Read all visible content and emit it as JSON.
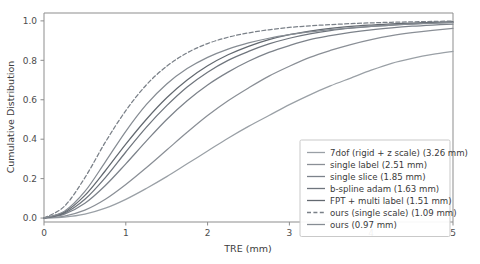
{
  "chart_data": {
    "type": "line",
    "title": "",
    "xlabel": "TRE (mm)",
    "ylabel": "Cumulative Distribution",
    "xlim": [
      0,
      5
    ],
    "ylim": [
      -0.02,
      1.04
    ],
    "xticks": [
      "0",
      "1",
      "2",
      "3",
      "4",
      "5"
    ],
    "xtick_values": [
      0,
      1,
      2,
      3,
      4,
      5
    ],
    "yticks": [
      "0.0",
      "0.2",
      "0.4",
      "0.6",
      "0.8",
      "1.0"
    ],
    "ytick_values": [
      0.0,
      0.2,
      0.4,
      0.6,
      0.8,
      1.0
    ],
    "grid": false,
    "legend_position": "lower right",
    "x": [
      0.0,
      0.25,
      0.5,
      0.75,
      1.0,
      1.25,
      1.5,
      1.75,
      2.0,
      2.25,
      2.5,
      2.75,
      3.0,
      3.25,
      3.5,
      3.75,
      4.0,
      4.25,
      4.5,
      4.75,
      5.0
    ],
    "series": [
      {
        "name": "7dof (rigid + z scale) (3.26 mm)",
        "label": "7dof (rigid + z scale) (3.26 mm)",
        "median_tre_mm": 3.26,
        "color": "#9aa0a6",
        "dash": "solid",
        "values": [
          0.0,
          0.005,
          0.02,
          0.05,
          0.095,
          0.15,
          0.21,
          0.275,
          0.34,
          0.405,
          0.465,
          0.52,
          0.575,
          0.625,
          0.67,
          0.71,
          0.75,
          0.785,
          0.81,
          0.83,
          0.845
        ]
      },
      {
        "name": "single label (2.51 mm)",
        "label": "single label (2.51 mm)",
        "median_tre_mm": 2.51,
        "color": "#8a8f96",
        "dash": "solid",
        "values": [
          0.0,
          0.01,
          0.04,
          0.095,
          0.17,
          0.255,
          0.345,
          0.435,
          0.52,
          0.595,
          0.66,
          0.72,
          0.77,
          0.815,
          0.85,
          0.88,
          0.905,
          0.925,
          0.94,
          0.952,
          0.962
        ]
      },
      {
        "name": "single slice (1.85 mm)",
        "label": "single slice (1.85 mm)",
        "median_tre_mm": 1.85,
        "color": "#7c828a",
        "dash": "solid",
        "values": [
          0.0,
          0.02,
          0.075,
          0.165,
          0.275,
          0.39,
          0.5,
          0.595,
          0.675,
          0.74,
          0.795,
          0.84,
          0.875,
          0.905,
          0.925,
          0.942,
          0.955,
          0.965,
          0.973,
          0.979,
          0.984
        ]
      },
      {
        "name": "b-spline adam (1.63 mm)",
        "label": "b-spline adam (1.63 mm)",
        "median_tre_mm": 1.63,
        "color": "#6f757d",
        "dash": "solid",
        "values": [
          0.0,
          0.025,
          0.095,
          0.205,
          0.335,
          0.46,
          0.57,
          0.665,
          0.74,
          0.8,
          0.845,
          0.883,
          0.912,
          0.934,
          0.951,
          0.963,
          0.972,
          0.979,
          0.985,
          0.989,
          0.993
        ]
      },
      {
        "name": "FPT + multi label (1.51 mm)",
        "label": "FPT + multi label (1.51 mm)",
        "median_tre_mm": 1.51,
        "color": "#636970",
        "dash": "solid",
        "values": [
          0.0,
          0.03,
          0.115,
          0.24,
          0.375,
          0.5,
          0.61,
          0.7,
          0.772,
          0.828,
          0.871,
          0.905,
          0.93,
          0.948,
          0.962,
          0.972,
          0.979,
          0.985,
          0.989,
          0.993,
          0.996
        ]
      },
      {
        "name": "ours (single scale) (1.09 mm)",
        "label": "ours (single scale) (1.09 mm)",
        "median_tre_mm": 1.09,
        "color": "#7a8088",
        "dash": "dashed",
        "values": [
          0.0,
          0.06,
          0.205,
          0.385,
          0.545,
          0.675,
          0.77,
          0.838,
          0.885,
          0.917,
          0.939,
          0.955,
          0.967,
          0.975,
          0.981,
          0.986,
          0.99,
          0.993,
          0.995,
          0.997,
          0.999
        ]
      },
      {
        "name": "ours (0.97 mm)",
        "label": "ours (0.97 mm)",
        "median_tre_mm": 0.97,
        "color": "#868c93",
        "dash": "solid",
        "values": [
          0.0,
          0.035,
          0.135,
          0.285,
          0.44,
          0.575,
          0.68,
          0.758,
          0.815,
          0.857,
          0.888,
          0.912,
          0.93,
          0.944,
          0.956,
          0.965,
          0.972,
          0.979,
          0.984,
          0.988,
          0.992
        ]
      }
    ]
  },
  "axes": {
    "x_label": "TRE (mm)",
    "y_label": "Cumulative Distribution"
  },
  "legend": {
    "items": [
      "7dof (rigid + z scale) (3.26 mm)",
      "single label (2.51 mm)",
      "single slice (1.85 mm)",
      "b-spline adam (1.63 mm)",
      "FPT + multi label (1.51 mm)",
      "ours (single scale) (1.09 mm)",
      "ours (0.97 mm)"
    ]
  },
  "style": {
    "background": "#ffffff",
    "axis_color": "#8d8d8d",
    "text_color": "#3d3d3d",
    "legend_border": "#c9c9c9"
  }
}
